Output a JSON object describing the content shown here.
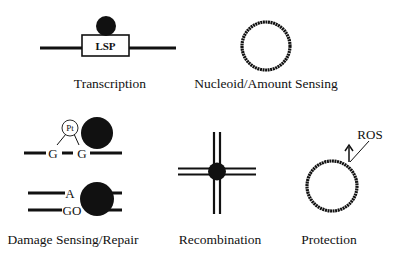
{
  "panels": {
    "transcription": {
      "label": "Transcription",
      "box_text": "LSP"
    },
    "nucleoid": {
      "label": "Nucleoid/Amount Sensing"
    },
    "damage": {
      "label": "Damage Sensing/Repair",
      "adduct": "Pt",
      "base1": "G",
      "base2": "G",
      "top_base": "A",
      "bottom_base": "GO"
    },
    "recombination": {
      "label": "Recombination"
    },
    "protection": {
      "label": "Protection",
      "annotation": "ROS"
    }
  },
  "colors": {
    "ink": "#111111",
    "background": "#ffffff"
  }
}
